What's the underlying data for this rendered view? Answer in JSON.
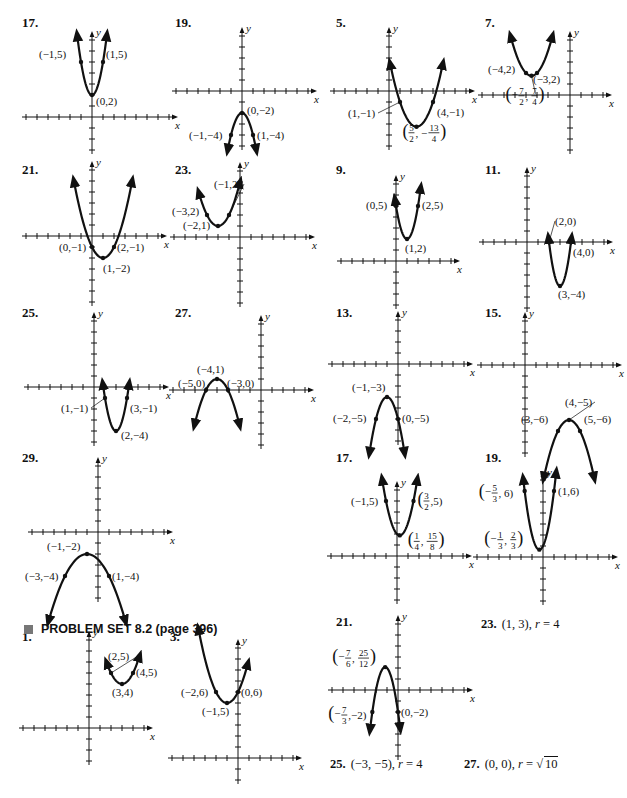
{
  "section_header": {
    "icon": "square-bullet-icon",
    "title": "PROBLEM SET 8.2 (page 396)"
  },
  "axis_labels": {
    "x": "x",
    "y": "y"
  },
  "problems": [
    {
      "id": "p17a",
      "number": "17.",
      "num_pos": [
        22,
        23
      ],
      "graph": {
        "ox": 92,
        "oy": 117,
        "u": 11,
        "xmin": -6,
        "xmax": 7,
        "ymin": -3,
        "ymax": 7,
        "a": 3,
        "h": 0,
        "k": 2,
        "xr": [
          -1.35,
          1.35
        ],
        "points": [
          {
            "x": -1,
            "y": 5,
            "label": "(−1,5)",
            "lx": -42,
            "ly": -4
          },
          {
            "x": 1,
            "y": 5,
            "label": "(1,5)",
            "lx": 3,
            "ly": -4
          },
          {
            "x": 0,
            "y": 2,
            "label": "(0,2)",
            "lx": 4,
            "ly": 10
          }
        ]
      }
    },
    {
      "id": "p19a",
      "number": "19.",
      "num_pos": [
        175,
        23
      ],
      "graph": {
        "ox": 242,
        "oy": 91,
        "u": 11,
        "xmin": -6,
        "xmax": 6,
        "ymin": -5,
        "ymax": 5,
        "a": -2,
        "h": 0,
        "k": -2,
        "xr": [
          -1.3,
          1.3
        ],
        "points": [
          {
            "x": 0,
            "y": -2,
            "label": "(0,−2)",
            "lx": 5,
            "ly": 1
          },
          {
            "x": -1,
            "y": -4,
            "label": "(−1,−4)",
            "lx": -42,
            "ly": 4
          },
          {
            "x": 1,
            "y": -4,
            "label": "(1,−4)",
            "lx": 4,
            "ly": 4
          }
        ]
      }
    },
    {
      "id": "p5",
      "number": "5.",
      "num_pos": [
        336,
        23
      ],
      "graph": {
        "ox": 389,
        "oy": 91,
        "u": 11,
        "xmin": -5,
        "xmax": 7,
        "ymin": -5,
        "ymax": 5,
        "a": 1,
        "h": 2.5,
        "k": -3.25,
        "xr": [
          0.1,
          4.9
        ],
        "points": [
          {
            "x": 1,
            "y": -1,
            "label": "(1,−1)",
            "lx": -52,
            "ly": 15,
            "leader": true
          },
          {
            "x": 4,
            "y": -1,
            "label": "(4,−1)",
            "lx": 4,
            "ly": 14
          },
          {
            "x": 2.5,
            "y": -3.25,
            "frac": [
              "5",
              "2",
              "13",
              "4"
            ],
            "lx": -14,
            "ly": 8
          }
        ]
      }
    },
    {
      "id": "p7",
      "number": "7.",
      "num_pos": [
        485,
        23
      ],
      "graph": {
        "ox": 570,
        "oy": 95,
        "u": 11,
        "xmin": -8,
        "xmax": 3,
        "ymin": -5,
        "ymax": 5,
        "a": 1,
        "h": -3.5,
        "k": 1.75,
        "xr": [
          -5.4,
          -1.6
        ],
        "points": [
          {
            "x": -4,
            "y": 2,
            "label": "(−4,2)",
            "lx": -38,
            "ly": 0
          },
          {
            "x": -3,
            "y": 2,
            "label": "(−3,2)",
            "lx": -4,
            "ly": 10
          },
          {
            "x": -3.5,
            "y": 1.75,
            "frac": [
              "7",
              "2",
              "7",
              "4"
            ],
            "neg1": true,
            "lx": -26,
            "ly": 22,
            "leader": true
          }
        ]
      }
    },
    {
      "id": "p21a",
      "number": "21.",
      "num_pos": [
        22,
        170
      ],
      "graph": {
        "ox": 92,
        "oy": 236,
        "u": 11,
        "xmin": -6,
        "xmax": 6,
        "ymin": -6,
        "ymax": 6,
        "a": 1,
        "h": 1,
        "k": -2,
        "xr": [
          -1.65,
          3.65
        ],
        "points": [
          {
            "x": 0,
            "y": -1,
            "label": "(0,−1)",
            "lx": -33,
            "ly": 4
          },
          {
            "x": 2,
            "y": -1,
            "label": "(2,−1)",
            "lx": 3,
            "ly": 4
          },
          {
            "x": 1,
            "y": -2,
            "label": "(1,−2)",
            "lx": 0,
            "ly": 14
          }
        ]
      }
    },
    {
      "id": "p23a",
      "number": "23.",
      "num_pos": [
        175,
        170
      ],
      "graph": {
        "ox": 240,
        "oy": 237,
        "u": 11,
        "xmin": -6,
        "xmax": 6,
        "ymin": -6,
        "ymax": 6,
        "a": 1,
        "h": -2,
        "k": 1,
        "xr": [
          -3.75,
          0
        ],
        "points": [
          {
            "x": -1,
            "y": 2,
            "label": "(−1,2)",
            "lx": -15,
            "ly": -27,
            "leader": true
          },
          {
            "x": -3,
            "y": 2,
            "label": "(−3,2)",
            "lx": -35,
            "ly": 0
          },
          {
            "x": -2,
            "y": 1,
            "label": "(−2,1)",
            "lx": -35,
            "ly": 3
          }
        ]
      }
    },
    {
      "id": "p9",
      "number": "9.",
      "num_pos": [
        336,
        170
      ],
      "graph": {
        "ox": 396,
        "oy": 261,
        "u": 11,
        "xmin": -5,
        "xmax": 5,
        "ymin": -4,
        "ymax": 7,
        "a": 3,
        "h": 1,
        "k": 2,
        "xr": [
          -0.1,
          2.25
        ],
        "points": [
          {
            "x": 0,
            "y": 5,
            "label": "(0,5)",
            "lx": -30,
            "ly": 3
          },
          {
            "x": 2,
            "y": 5,
            "label": "(2,5)",
            "lx": 4,
            "ly": 3
          },
          {
            "x": 1,
            "y": 2,
            "label": "(1,2)",
            "lx": -2,
            "ly": 13
          }
        ]
      }
    },
    {
      "id": "p11",
      "number": "11.",
      "num_pos": [
        485,
        170
      ],
      "graph": {
        "ox": 527,
        "oy": 242,
        "u": 11,
        "xmin": -4,
        "xmax": 7,
        "ymin": -6,
        "ymax": 6,
        "a": 4,
        "h": 3,
        "k": -4,
        "xr": [
          1.95,
          4.05
        ],
        "points": [
          {
            "x": 2,
            "y": 0,
            "label": "(2,0)",
            "lx": 6,
            "ly": -17,
            "leader": true
          },
          {
            "x": 4,
            "y": 0,
            "label": "(4,0)",
            "lx": 2,
            "ly": 14
          },
          {
            "x": 3,
            "y": -4,
            "label": "(3,−4)",
            "lx": -2,
            "ly": 12
          }
        ]
      }
    },
    {
      "id": "p25",
      "number": "25.",
      "num_pos": [
        22,
        313
      ],
      "graph": {
        "ox": 94,
        "oy": 387,
        "u": 11,
        "xmin": -6,
        "xmax": 6,
        "ymin": -5,
        "ymax": 6,
        "a": 3,
        "h": 2,
        "k": -4,
        "xr": [
          0.8,
          3.2
        ],
        "points": [
          {
            "x": 1,
            "y": -1,
            "label": "(1,−1)",
            "lx": -44,
            "ly": 14,
            "leader": true
          },
          {
            "x": 3,
            "y": -1,
            "label": "(3,−1)",
            "lx": 3,
            "ly": 14
          },
          {
            "x": 2,
            "y": -4,
            "label": "(2,−4)",
            "lx": 5,
            "ly": 8
          }
        ]
      }
    },
    {
      "id": "p27",
      "number": "27.",
      "num_pos": [
        175,
        313
      ],
      "graph": {
        "ox": 261,
        "oy": 390,
        "u": 11,
        "xmin": -8,
        "xmax": 4,
        "ymin": -5,
        "ymax": 6,
        "a": -1,
        "h": -4,
        "k": 1,
        "xr": [
          -6.05,
          -1.95
        ],
        "points": [
          {
            "x": -4,
            "y": 1,
            "label": "(−4,1)",
            "lx": -20,
            "ly": -6
          },
          {
            "x": -5,
            "y": 0,
            "label": "(−5,0)",
            "lx": -28,
            "ly": -3
          },
          {
            "x": -3,
            "y": 0,
            "label": "(−3,0)",
            "lx": -1,
            "ly": -3
          }
        ]
      }
    },
    {
      "id": "p13",
      "number": "13.",
      "num_pos": [
        336,
        313
      ],
      "graph": {
        "ox": 398,
        "oy": 364,
        "u": 11,
        "xmin": -6,
        "xmax": 6,
        "ymin": -7,
        "ymax": 4,
        "a": -2,
        "h": -1,
        "k": -3,
        "xr": [
          -2.6,
          0.6
        ],
        "points": [
          {
            "x": -1,
            "y": -3,
            "label": "(−1,−3)",
            "lx": -35,
            "ly": -6
          },
          {
            "x": -2,
            "y": -5,
            "label": "(−2,−5)",
            "lx": -43,
            "ly": 3
          },
          {
            "x": 0,
            "y": -5,
            "label": "(0,−5)",
            "lx": 4,
            "ly": 3
          }
        ]
      }
    },
    {
      "id": "p15",
      "number": "15.",
      "num_pos": [
        485,
        313
      ],
      "graph": {
        "ox": 525,
        "oy": 365,
        "u": 11,
        "xmin": -4,
        "xmax": 8,
        "ymin": -8,
        "ymax": 4,
        "a": -1,
        "h": 4,
        "k": -5,
        "xr": [
          1.7,
          6.3
        ],
        "points": [
          {
            "x": 4,
            "y": -5,
            "label": "(4,−5)",
            "lx": -4,
            "ly": -14,
            "leader": true
          },
          {
            "x": 3,
            "y": -6,
            "label": "(3,−6)",
            "lx": -37,
            "ly": -8
          },
          {
            "x": 5,
            "y": -6,
            "label": "(5,−6)",
            "lx": 4,
            "ly": -8
          }
        ]
      }
    },
    {
      "id": "p29",
      "number": "29.",
      "num_pos": [
        22,
        458
      ],
      "graph": {
        "ox": 98,
        "oy": 532,
        "u": 11,
        "xmin": -6,
        "xmax": 6,
        "ymin": -6,
        "ymax": 6,
        "a": -0.5,
        "h": -1,
        "k": -2,
        "xr": [
          -4.5,
          2.5
        ],
        "points": [
          {
            "x": -1,
            "y": -2,
            "label": "(−1,−2)",
            "lx": -40,
            "ly": -4
          },
          {
            "x": -3,
            "y": -4,
            "label": "(−3,−4)",
            "lx": -40,
            "ly": 4
          },
          {
            "x": 1,
            "y": -4,
            "label": "(1,−4)",
            "lx": 3,
            "ly": 4
          }
        ]
      }
    },
    {
      "id": "p17b",
      "number": "17.",
      "num_pos": [
        336,
        458
      ],
      "graph": {
        "ox": 397,
        "oy": 556,
        "u": 11,
        "xmin": -6,
        "xmax": 6,
        "ymin": -4,
        "ymax": 6,
        "a": 2,
        "h": 0.25,
        "k": 1.875,
        "xr": [
          -1.35,
          1.85
        ],
        "points": [
          {
            "x": -1,
            "y": 5,
            "label": "(−1,5)",
            "lx": -35,
            "ly": 4
          },
          {
            "x": 1.5,
            "y": 5,
            "frac2": [
              "3",
              "2",
              "5"
            ],
            "lx": 4,
            "ly": 2
          },
          {
            "x": 0.25,
            "y": 1.875,
            "frac": [
              "1",
              "4",
              "15",
              "8"
            ],
            "lx": 8,
            "ly": 8
          }
        ]
      }
    },
    {
      "id": "p19b",
      "number": "19.",
      "num_pos": [
        485,
        458
      ],
      "graph": {
        "ox": 543,
        "oy": 557,
        "u": 11,
        "xmin": -6,
        "xmax": 6,
        "ymin": -4,
        "ymax": 7,
        "a": 3,
        "h": -0.333,
        "k": 0.667,
        "xr": [
          -1.8,
          1.2
        ],
        "points": [
          {
            "x": -1.667,
            "y": 6,
            "frac3": [
              "5",
              "3",
              "6"
            ],
            "neg1": true,
            "lx": -46,
            "ly": 4
          },
          {
            "x": 1,
            "y": 6,
            "label": "(1,6)",
            "lx": 4,
            "ly": 4
          },
          {
            "x": -0.333,
            "y": 0.667,
            "frac": [
              "1",
              "3",
              "2",
              "3"
            ],
            "neg1": true,
            "lx": -55,
            "ly": -8
          }
        ]
      }
    },
    {
      "id": "p1",
      "number": "1.",
      "num_pos": [
        22,
        637
      ],
      "graph": {
        "ox": 89,
        "oy": 728,
        "u": 11,
        "xmin": -6,
        "xmax": 5,
        "ymin": -3,
        "ymax": 8,
        "a": 1,
        "h": 3,
        "k": 4,
        "xr": [
          1.6,
          4.6
        ],
        "points": [
          {
            "x": 2,
            "y": 5,
            "label": "(2,5)",
            "lx": -3,
            "ly": -13,
            "leader": true
          },
          {
            "x": 4,
            "y": 5,
            "label": "(4,5)",
            "lx": 3,
            "ly": 3
          },
          {
            "x": 3,
            "y": 4,
            "label": "(3,4)",
            "lx": -10,
            "ly": 12
          }
        ]
      }
    },
    {
      "id": "p3",
      "number": "3.",
      "num_pos": [
        170,
        637
      ],
      "graph": {
        "ox": 238,
        "oy": 758,
        "u": 11,
        "xmin": -6,
        "xmax": 5,
        "ymin": -2,
        "ymax": 10,
        "a": 1,
        "h": -1,
        "k": 5,
        "xr": [
          -3.6,
          0.9
        ],
        "points": [
          {
            "x": -2,
            "y": 6,
            "label": "(−2,6)",
            "lx": -35,
            "ly": 4
          },
          {
            "x": 0,
            "y": 6,
            "label": "(0,6)",
            "lx": 3,
            "ly": 4
          },
          {
            "x": -1,
            "y": 5,
            "label": "(−1,5)",
            "lx": -25,
            "ly": 12
          }
        ]
      }
    },
    {
      "id": "p21b",
      "number": "21.",
      "num_pos": [
        336,
        622
      ],
      "graph": {
        "ox": 398,
        "oy": 690,
        "u": 11,
        "xmin": -6,
        "xmax": 6,
        "ymin": -6,
        "ymax": 6,
        "a": -3,
        "h": -1.167,
        "k": 2.083,
        "xr": [
          -2.55,
          0.2
        ],
        "points": [
          {
            "x": -1.167,
            "y": 2.083,
            "frac": [
              "7",
              "6",
              "25",
              "12"
            ],
            "neg1": true,
            "lx": -53,
            "ly": -7
          },
          {
            "x": -2.333,
            "y": -2,
            "frac4": [
              "7",
              "3",
              "−2"
            ],
            "neg1": true,
            "lx": -44,
            "ly": 5
          },
          {
            "x": 0,
            "y": -2,
            "label": "(0,−2)",
            "lx": 3,
            "ly": 4
          }
        ]
      }
    }
  ],
  "text_answers": [
    {
      "id": "a23",
      "number": "23.",
      "text": "(1, 3), ",
      "var": "r",
      "rest": " = 4",
      "pos": [
        481,
        625
      ]
    },
    {
      "id": "a25",
      "number": "25.",
      "text": "(−3, −5), ",
      "var": "r",
      "rest": " = 4",
      "pos": [
        330,
        765
      ]
    },
    {
      "id": "a27",
      "number": "27.",
      "text": "(0, 0), ",
      "var": "r",
      "rest": " = ",
      "radical": "10",
      "pos": [
        464,
        765
      ]
    }
  ]
}
